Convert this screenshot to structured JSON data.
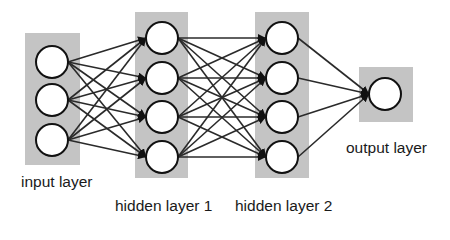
{
  "diagram": {
    "type": "feedforward-neural-network",
    "colors": {
      "layer_box": "#c4c4c4",
      "node_fill": "#ffffff",
      "node_stroke": "#111111",
      "edge": "#2a2a2a",
      "text": "#1a1a1a"
    },
    "layers": [
      {
        "id": "input",
        "label": "input layer",
        "node_count": 3
      },
      {
        "id": "hidden1",
        "label": "hidden layer 1",
        "node_count": 4
      },
      {
        "id": "hidden2",
        "label": "hidden layer 2",
        "node_count": 4
      },
      {
        "id": "output",
        "label": "output layer",
        "node_count": 1
      }
    ],
    "connections": "fully-connected between consecutive layers, directed left to right"
  }
}
